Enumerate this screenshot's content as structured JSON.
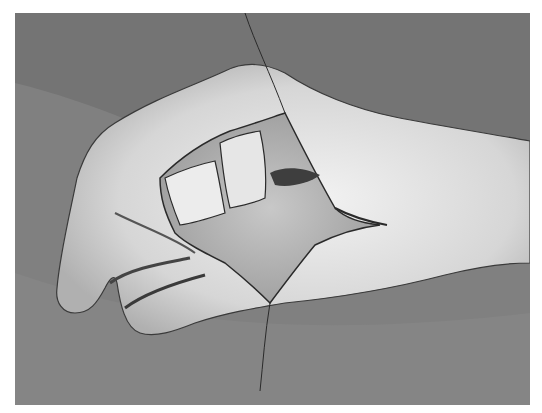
{
  "image": {
    "subject": "grayscale clinical photograph of a hand with a flap on the dorsum",
    "background_color": "#ffffff",
    "drape_color": "#7e7e7e",
    "skin_color": "#d9d9d9",
    "wound_color": "#a8a8a8",
    "suture_color": "#2a2a2a"
  }
}
